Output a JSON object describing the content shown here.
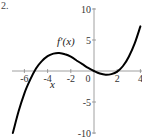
{
  "figure": {
    "label": "2."
  },
  "chart_data": {
    "type": "line",
    "title": "",
    "curve_label": "f′(x)",
    "xlabel": "x",
    "ylabel": "",
    "xlim": [
      -7,
      4
    ],
    "ylim": [
      -10,
      10
    ],
    "x_ticks": [
      -6,
      -4,
      -2,
      0,
      2,
      4
    ],
    "x_tick_labels": [
      "-6",
      "-4",
      "-2",
      "0",
      "2",
      "4"
    ],
    "y_ticks": [
      10,
      5,
      -5,
      -10
    ],
    "y_tick_labels": [
      "10",
      "5",
      "-5",
      "-10"
    ],
    "grid": false,
    "legend": null,
    "series": [
      {
        "name": "f′(x)",
        "color": "#000000",
        "x": [
          -7,
          -6.5,
          -6,
          -5.5,
          -5,
          -4.5,
          -4,
          -3.5,
          -3,
          -2.5,
          -2,
          -1.5,
          -1,
          -0.5,
          0,
          0.5,
          1,
          1.5,
          2,
          2.5,
          3,
          3.5,
          4
        ],
        "y": [
          -10,
          -6.5,
          -3.6,
          -1.4,
          0.4,
          1.6,
          2.4,
          2.8,
          2.9,
          2.7,
          2.3,
          1.7,
          1.1,
          0.5,
          0,
          -0.4,
          -0.6,
          -0.5,
          -0.1,
          0.8,
          2.3,
          4.4,
          7.2
        ]
      }
    ]
  }
}
